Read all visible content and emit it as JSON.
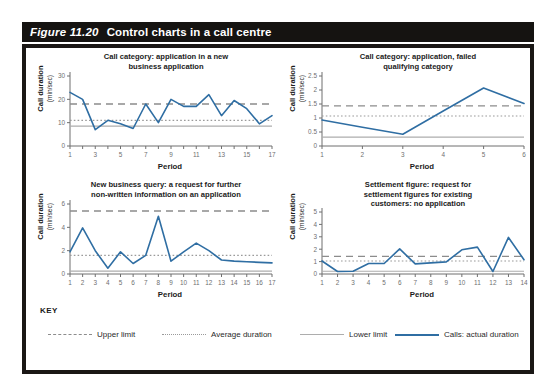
{
  "figure": {
    "number": "Figure 11.20",
    "title": "Control charts in a call centre"
  },
  "colors": {
    "title_bar_bg": "#151311",
    "title_bar_text": "#ffffff",
    "panel_border": "#1a1715",
    "series_line": "#2f6ea3",
    "upper_limit": "#8c8c8c",
    "average": "#9a9a9a",
    "lower_limit": "#adadad",
    "tick_text": "#6f6f6f"
  },
  "key": {
    "heading": "KEY",
    "items": [
      {
        "label": "Upper limit",
        "style": "dashed",
        "color": "#8c8c8c"
      },
      {
        "label": "Average duration",
        "style": "dotted",
        "color": "#9a9a9a"
      },
      {
        "label": "Lower limit",
        "style": "solid",
        "color": "#adadad"
      },
      {
        "label": "Calls: actual duration",
        "style": "solid-thick",
        "color": "#2f6ea3"
      }
    ]
  },
  "chart_data": [
    {
      "type": "line",
      "id": "chart-application-new-business",
      "title": "Call category: application in a new\nbusiness application",
      "xlabel": "Period",
      "ylabel": "Call duration",
      "ylabel_sub": "(min/sec)",
      "x": [
        1,
        2,
        3,
        4,
        5,
        6,
        7,
        8,
        9,
        10,
        11,
        12,
        13,
        14,
        15,
        16,
        17
      ],
      "xticklabels": [
        "1",
        "",
        "3",
        "",
        "5",
        "",
        "7",
        "",
        "9",
        "",
        "11",
        "",
        "13",
        "",
        "15",
        "",
        "17"
      ],
      "yticks": [
        0,
        10,
        20,
        30
      ],
      "yticklabels": [
        "0",
        "10",
        "20",
        "30"
      ],
      "ylim": [
        0,
        30
      ],
      "xlim": [
        1,
        17
      ],
      "grid": false,
      "series": [
        {
          "name": "Calls: actual duration",
          "values": [
            23,
            20,
            7,
            11,
            9.5,
            7.5,
            18,
            10,
            20,
            17,
            17,
            22,
            13,
            19.5,
            16,
            9.5,
            13
          ]
        }
      ],
      "upper_limit": 18,
      "average": 11,
      "lower_limit": 8.5
    },
    {
      "type": "line",
      "id": "chart-failed-qualifying",
      "title": "Call category: application, failed\nqualifying category",
      "xlabel": "Period",
      "ylabel": "Call duration",
      "ylabel_sub": "(min/sec)",
      "x": [
        1,
        2,
        3,
        4,
        5,
        6
      ],
      "xticklabels": [
        "1",
        "2",
        "3",
        "4",
        "5",
        "6"
      ],
      "yticks": [
        0,
        0.5,
        1,
        1.5,
        2,
        2.5
      ],
      "yticklabels": [
        "0",
        "0.5",
        "1",
        "1.5",
        "2",
        "2.5"
      ],
      "ylim": [
        0,
        2.5
      ],
      "xlim": [
        1,
        6
      ],
      "grid": false,
      "series": [
        {
          "name": "Calls: actual duration",
          "values": [
            0.93,
            0.67,
            0.42,
            1.25,
            2.07,
            1.52
          ]
        }
      ],
      "upper_limit": 1.43,
      "average": 1.07,
      "lower_limit": 0.32
    },
    {
      "type": "line",
      "id": "chart-new-business-query",
      "title": "New business query: a request for further\nnon-written information on an application",
      "xlabel": "Period",
      "ylabel": "Call duration",
      "ylabel_sub": "(min/sec)",
      "x": [
        1,
        2,
        3,
        4,
        5,
        6,
        7,
        8,
        9,
        10,
        11,
        12,
        13,
        14,
        15,
        16,
        17
      ],
      "xticklabels": [
        "1",
        "2",
        "3",
        "4",
        "5",
        "6",
        "7",
        "8",
        "9",
        "10",
        "11",
        "12",
        "13",
        "14",
        "15",
        "16",
        "17"
      ],
      "yticks": [
        0,
        2,
        4,
        6
      ],
      "yticklabels": [
        "0",
        "2",
        "4",
        "6"
      ],
      "ylim": [
        0,
        6
      ],
      "xlim": [
        1,
        17
      ],
      "grid": false,
      "series": [
        {
          "name": "Calls: actual duration",
          "values": [
            1.9,
            3.95,
            2.0,
            0.5,
            1.9,
            0.9,
            1.6,
            4.95,
            1.1,
            1.9,
            2.65,
            2.0,
            1.2,
            1.1,
            1.05,
            1.0,
            0.95
          ]
        }
      ],
      "upper_limit": 5.4,
      "average": 1.6,
      "lower_limit": 0.25
    },
    {
      "type": "line",
      "id": "chart-settlement-figure",
      "title": "Settlement figure: request for\nsettlement figures for existing\ncustomers: no application",
      "xlabel": "Period",
      "ylabel": "Call duration",
      "ylabel_sub": "(min/sec)",
      "x": [
        1,
        2,
        3,
        4,
        5,
        6,
        7,
        8,
        9,
        10,
        11,
        12,
        13,
        14
      ],
      "xticklabels": [
        "1",
        "2",
        "3",
        "4",
        "5",
        "6",
        "7",
        "8",
        "9",
        "10",
        "11",
        "12",
        "13",
        "14"
      ],
      "yticks": [
        0,
        1,
        2,
        3,
        4,
        5
      ],
      "yticklabels": [
        "0",
        "1",
        "2",
        "3",
        "4",
        "5"
      ],
      "ylim": [
        0,
        5
      ],
      "xlim": [
        1,
        14
      ],
      "grid": false,
      "series": [
        {
          "name": "Calls: actual duration",
          "values": [
            1.05,
            0.2,
            0.22,
            0.85,
            0.85,
            2.02,
            0.82,
            0.9,
            0.98,
            1.95,
            2.17,
            0.2,
            2.95,
            1.15
          ]
        }
      ],
      "upper_limit": 1.42,
      "average": 1.05,
      "lower_limit": 0.22
    }
  ]
}
